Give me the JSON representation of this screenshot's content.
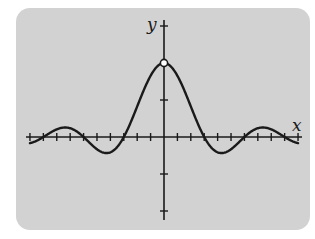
{
  "chart_data": {
    "type": "line",
    "title": "",
    "xlabel": "x",
    "ylabel": "y",
    "function": "y = sin(x)/x",
    "x_tick_step": 1.0472,
    "x_tick_count_each_side": 10,
    "y_ticks": [
      -1,
      -0.5,
      0.5,
      1,
      1.5
    ],
    "xlim": [
      -10.472,
      10.472
    ],
    "ylim": [
      -1.15,
      1.6
    ],
    "hole": {
      "x": 0,
      "y": 1,
      "note": "open circle (undefined at x=0)"
    },
    "zero_crossings": [
      -6.283,
      -3.1416,
      3.1416,
      6.283
    ],
    "sample_points": [
      {
        "x": -10.472,
        "y": -0.083
      },
      {
        "x": -7.725,
        "y": 0.128
      },
      {
        "x": -6.283,
        "y": 0
      },
      {
        "x": -4.493,
        "y": -0.217
      },
      {
        "x": -3.1416,
        "y": 0
      },
      {
        "x": 0,
        "y": 1
      },
      {
        "x": 3.1416,
        "y": 0
      },
      {
        "x": 4.493,
        "y": -0.217
      },
      {
        "x": 6.283,
        "y": 0
      },
      {
        "x": 7.725,
        "y": 0.128
      },
      {
        "x": 10.472,
        "y": -0.083
      }
    ],
    "grid": false,
    "legend": null
  },
  "colors": {
    "panel": "#d2d2d2",
    "ink": "#1a1a1a",
    "hole_fill": "#ffffff"
  },
  "labels": {
    "x_axis": "x",
    "y_axis": "y"
  },
  "layout": {
    "origin_px": [
      164,
      137
    ],
    "x_px_per_unit": 12.8,
    "y_px_per_unit": 74
  }
}
